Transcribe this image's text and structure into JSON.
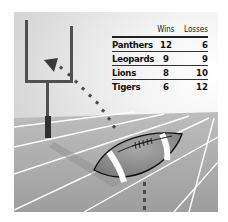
{
  "table": {
    "headers": [
      "",
      "Wins",
      "Losses"
    ],
    "rows": [
      {
        "team": "Panthers",
        "wins": "12",
        "losses": "6"
      },
      {
        "team": "Leopards",
        "wins": "9",
        "losses": "9"
      },
      {
        "team": "Lions",
        "wins": "8",
        "losses": "10"
      },
      {
        "team": "Tigers",
        "wins": "6",
        "losses": "12"
      }
    ]
  },
  "illustration": {
    "elements": [
      "goalpost",
      "football",
      "dotted-trajectory",
      "arrowhead",
      "field-yard-lines"
    ],
    "colors": {
      "goalpost": "#4a4a4a",
      "post-base": "#2e2e2e",
      "field": "#a9a9a9",
      "lines": "#ffffff",
      "ball": "#8a8a8a",
      "dots": "#555555"
    }
  }
}
